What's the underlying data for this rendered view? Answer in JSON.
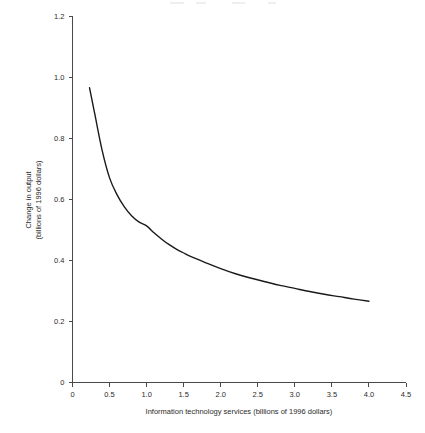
{
  "chart_data": {
    "type": "line",
    "title": "",
    "subtitle": "",
    "xlabel": "Information technology services (billions of 1996 dollars)",
    "ylabel": "Change in output\n(billions of 1996 dollars)",
    "ylabel_line1": "Change in output",
    "ylabel_line2": "(billions of 1996 dollars)",
    "xlim": [
      0,
      4.5
    ],
    "ylim": [
      0,
      1.2
    ],
    "grid": false,
    "legend": null,
    "xticks": [
      0,
      0.5,
      1.0,
      1.5,
      2.0,
      2.5,
      3.0,
      3.5,
      4.0,
      4.5
    ],
    "xtick_labels": [
      "0",
      "0.5",
      "1.0",
      "1.5",
      "2.0",
      "2.5",
      "3.0",
      "3.5",
      "4.0",
      "4.5"
    ],
    "yticks": [
      0,
      0.2,
      0.4,
      0.6,
      0.8,
      1.0,
      1.2
    ],
    "ytick_labels": [
      "0",
      "0.2",
      "0.4",
      "0.6",
      "0.8",
      "1.0",
      "1.2"
    ],
    "series": [
      {
        "name": "Change in output",
        "color": "#1a1a1a",
        "x": [
          0.23,
          0.3,
          0.4,
          0.5,
          0.6,
          0.7,
          0.8,
          0.9,
          1.0,
          1.1,
          1.2,
          1.3,
          1.4,
          1.5,
          1.6,
          1.8,
          2.0,
          2.2,
          2.4,
          2.6,
          2.8,
          3.0,
          3.2,
          3.4,
          3.6,
          3.8,
          4.0
        ],
        "y": [
          0.965,
          0.88,
          0.76,
          0.67,
          0.615,
          0.575,
          0.545,
          0.525,
          0.513,
          0.49,
          0.47,
          0.452,
          0.437,
          0.424,
          0.412,
          0.392,
          0.373,
          0.356,
          0.342,
          0.33,
          0.318,
          0.308,
          0.298,
          0.289,
          0.281,
          0.273,
          0.266
        ]
      }
    ]
  },
  "axes": {
    "x_axis_name": "x-axis",
    "y_axis_name": "y-axis"
  }
}
